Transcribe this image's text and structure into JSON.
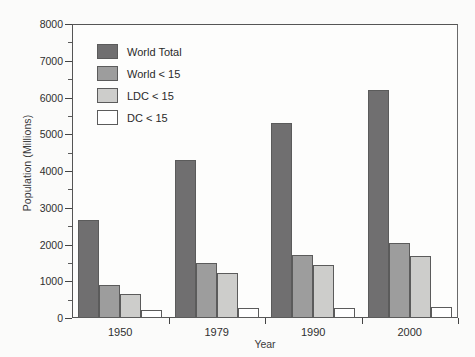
{
  "chart_data": {
    "type": "bar",
    "title": "",
    "xlabel": "Year",
    "ylabel": "Population (Millions)",
    "categories": [
      "1950",
      "1979",
      "1990",
      "2000"
    ],
    "ylim": [
      0,
      8000
    ],
    "ytick_labels": [
      "0",
      "1000",
      "2000",
      "3000",
      "4000",
      "5000",
      "6000",
      "7000",
      "8000"
    ],
    "ytick_values": [
      0,
      1000,
      2000,
      3000,
      4000,
      5000,
      6000,
      7000,
      8000
    ],
    "minor_tick_interval": 500,
    "grid": false,
    "legend_position": "upper-left-inside",
    "series": [
      {
        "name": "World Total",
        "color": "#706f70",
        "values": [
          2670,
          4300,
          5300,
          6200
        ]
      },
      {
        "name": "World < 15",
        "color": "#9d9d9d",
        "values": [
          890,
          1510,
          1720,
          2030
        ]
      },
      {
        "name": "LDC < 15",
        "color": "#cdcdcb",
        "values": [
          640,
          1230,
          1440,
          1700
        ]
      },
      {
        "name": "DC < 15",
        "color": "#ffffff",
        "values": [
          230,
          280,
          270,
          300
        ]
      }
    ]
  },
  "axis": {
    "x_title": "Year",
    "y_title": "Population (Millions)"
  }
}
